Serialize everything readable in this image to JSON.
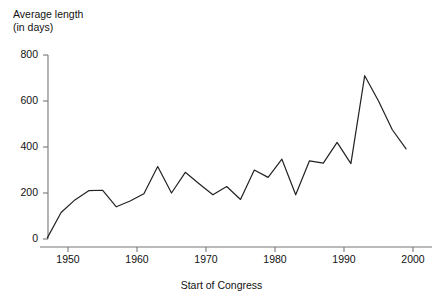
{
  "chart_data": {
    "type": "line",
    "title": "",
    "subtitle": "",
    "ylabel_line1": "Average length",
    "ylabel_line2": "(in days)",
    "xlabel": "Start of Congress",
    "xlim": [
      1947,
      2000
    ],
    "ylim": [
      0,
      800
    ],
    "grid": false,
    "legend": "none",
    "x_ticks": [
      1950,
      1960,
      1970,
      1980,
      1990,
      2000
    ],
    "x_tick_labels": [
      "1950",
      "1960",
      "1970",
      "1980",
      "1990",
      "2000"
    ],
    "y_ticks": [
      0,
      200,
      400,
      600,
      800
    ],
    "y_tick_labels": [
      "0",
      "200",
      "400",
      "600",
      "800"
    ],
    "series": [
      {
        "name": "Average length of Congress (days)",
        "color": "#222222",
        "x": [
          1947,
          1949,
          1951,
          1953,
          1955,
          1957,
          1959,
          1961,
          1963,
          1965,
          1967,
          1969,
          1971,
          1973,
          1975,
          1977,
          1979,
          1981,
          1983,
          1985,
          1987,
          1989,
          1991,
          1993,
          1995,
          1997,
          1999
        ],
        "values": [
          5,
          115,
          170,
          210,
          212,
          140,
          165,
          197,
          315,
          200,
          290,
          240,
          192,
          228,
          172,
          300,
          268,
          347,
          192,
          340,
          330,
          420,
          328,
          710,
          600,
          475,
          392
        ]
      }
    ]
  },
  "axes": {
    "y_title": "Average length\n(in days)",
    "x_title": "Start of Congress"
  }
}
